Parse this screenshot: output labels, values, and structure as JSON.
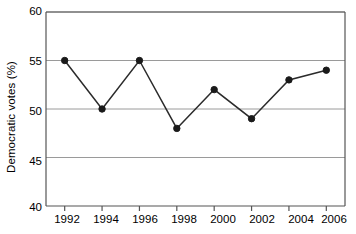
{
  "chart_data": {
    "type": "line",
    "title": "",
    "subtitle": "",
    "xlabel": "",
    "ylabel": "Democratic votes (%)",
    "categories": [
      "1992",
      "1994",
      "1996",
      "1998",
      "2000",
      "2002",
      "2004",
      "2006"
    ],
    "x": [
      1992,
      1994,
      1996,
      1998,
      2000,
      2002,
      2004,
      2006
    ],
    "values": [
      55,
      50,
      55,
      48,
      52,
      49,
      53,
      54
    ],
    "series": [
      {
        "name": "Democratic votes",
        "values": [
          55,
          50,
          55,
          48,
          52,
          49,
          53,
          54
        ]
      }
    ],
    "xlim": [
      1991,
      2007
    ],
    "ylim": [
      40,
      60
    ],
    "y_ticks": [
      40,
      45,
      50,
      55,
      60
    ],
    "y_tick_labels": [
      "40",
      "45",
      "50",
      "55",
      "60"
    ],
    "x_ticks": [
      1992,
      1994,
      1996,
      1998,
      2000,
      2002,
      2004,
      2006
    ],
    "x_tick_labels": [
      "1992",
      "1994",
      "1996",
      "1998",
      "2000",
      "2002",
      "2004",
      "2006"
    ],
    "grid": "horizontal",
    "legend": "none",
    "marker": "filled-circle",
    "line_color": "#2b2b2b",
    "marker_color": "#1a1a1a",
    "grid_color": "#9a9a9a",
    "axis_color": "#555555",
    "background_color": "#ffffff"
  }
}
